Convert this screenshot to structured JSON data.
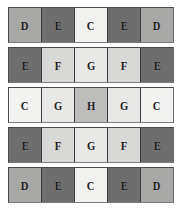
{
  "figure": {
    "type": "letter-grid",
    "rows": 5,
    "columns": 5,
    "background": "#ffffff"
  },
  "legend": {
    "shades": {
      "C": "#f2f2f0",
      "D": "#a8a8a6",
      "E": "#6e6e6e",
      "F": "#d8d8d6",
      "G": "#e8e8e6",
      "H": "#bdbdbb"
    },
    "text_color": "#1d1d1d",
    "divider_color": "#3a3a3a"
  },
  "grid": {
    "rows": [
      {
        "index": 1,
        "cells": [
          {
            "label": "D",
            "color": "#a8a8a6"
          },
          {
            "label": "E",
            "color": "#6e6e6e"
          },
          {
            "label": "C",
            "color": "#f2f2f0"
          },
          {
            "label": "E",
            "color": "#6e6e6e"
          },
          {
            "label": "D",
            "color": "#a8a8a6"
          }
        ]
      },
      {
        "index": 2,
        "cells": [
          {
            "label": "E",
            "color": "#6e6e6e"
          },
          {
            "label": "F",
            "color": "#d8d8d6"
          },
          {
            "label": "G",
            "color": "#e8e8e6"
          },
          {
            "label": "F",
            "color": "#d8d8d6"
          },
          {
            "label": "E",
            "color": "#6e6e6e"
          }
        ]
      },
      {
        "index": 3,
        "cells": [
          {
            "label": "C",
            "color": "#f2f2f0"
          },
          {
            "label": "G",
            "color": "#e8e8e6"
          },
          {
            "label": "H",
            "color": "#bdbdbb"
          },
          {
            "label": "G",
            "color": "#e8e8e6"
          },
          {
            "label": "C",
            "color": "#f2f2f0"
          }
        ]
      },
      {
        "index": 4,
        "cells": [
          {
            "label": "E",
            "color": "#6e6e6e"
          },
          {
            "label": "F",
            "color": "#d8d8d6"
          },
          {
            "label": "G",
            "color": "#e8e8e6"
          },
          {
            "label": "F",
            "color": "#d8d8d6"
          },
          {
            "label": "E",
            "color": "#6e6e6e"
          }
        ]
      },
      {
        "index": 5,
        "cells": [
          {
            "label": "D",
            "color": "#a8a8a6"
          },
          {
            "label": "E",
            "color": "#6e6e6e"
          },
          {
            "label": "C",
            "color": "#f2f2f0"
          },
          {
            "label": "E",
            "color": "#6e6e6e"
          },
          {
            "label": "D",
            "color": "#a8a8a6"
          }
        ]
      }
    ]
  }
}
